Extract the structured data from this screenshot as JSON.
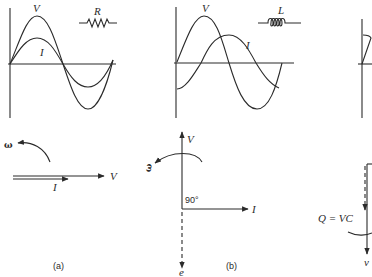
{
  "panels": [
    {
      "id": "a",
      "caption": "(a)",
      "component_label": "R",
      "component": "resistor",
      "waveform_labels": {
        "voltage": "V",
        "current": "I"
      },
      "phasor_labels": {
        "omega": "ω",
        "voltage": "V",
        "current": "I"
      },
      "phase_relation": "in phase"
    },
    {
      "id": "b",
      "caption": "(b)",
      "component_label": "L",
      "component": "inductor",
      "waveform_labels": {
        "voltage": "V",
        "current": "I"
      },
      "phasor_labels": {
        "omega": "ω",
        "voltage": "V",
        "current": "I",
        "emf": "e",
        "angle": "90°"
      },
      "phase_relation": "current lags voltage by 90°"
    },
    {
      "id": "c",
      "caption": "",
      "phasor_labels": {
        "charge": "Q = VC",
        "voltage": "v"
      },
      "partial": true
    }
  ]
}
